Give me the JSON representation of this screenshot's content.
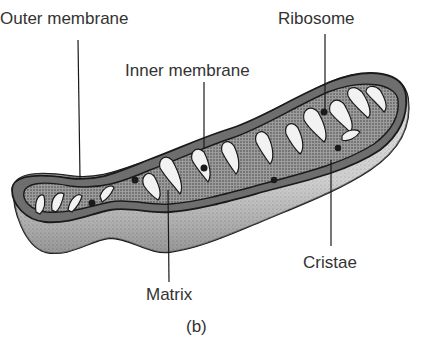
{
  "figure": {
    "caption": "(b)",
    "labels": {
      "outer_membrane": "Outer membrane",
      "inner_membrane": "Inner membrane",
      "ribosome": "Ribosome",
      "cristae": "Cristae",
      "matrix": "Matrix"
    },
    "colors": {
      "background": "#ffffff",
      "outline": "#1a1a1a",
      "membrane_fill": "#6e6e6e",
      "matrix_fill": "#a8a8a8",
      "outer_surface": "#d9d9d9",
      "cristae_fill": "#f2f2f2",
      "text": "#333333"
    }
  }
}
